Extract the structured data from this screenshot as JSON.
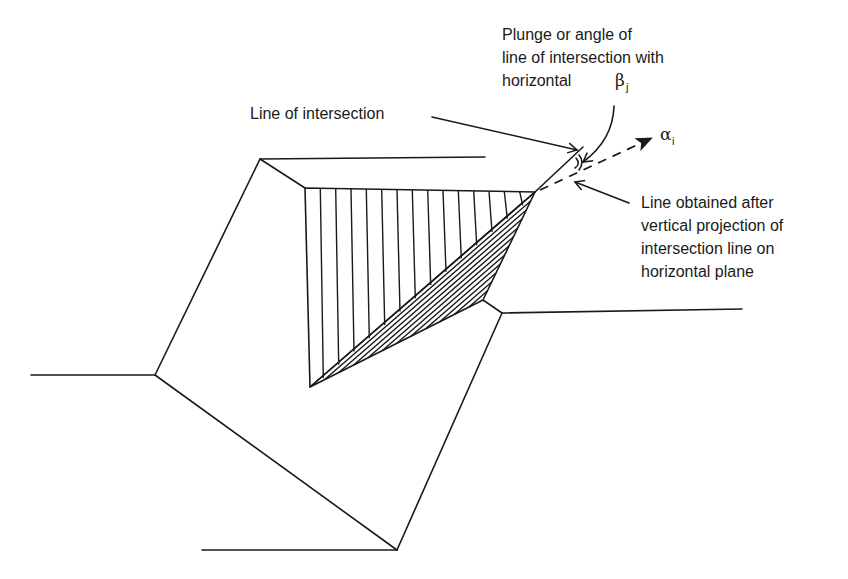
{
  "figure": {
    "type": "rock-wedge-slope-diagram",
    "labels": {
      "line_of_intersection": "Line of intersection",
      "plunge_line1": "Plunge or angle of",
      "plunge_line2": "line of intersection with",
      "plunge_line3": "horizontal",
      "projection_line1": "Line obtained after",
      "projection_line2": "vertical projection of",
      "projection_line3": "intersection line on",
      "projection_line4": "horizontal plane"
    },
    "symbols": {
      "beta": "β",
      "beta_sub": "j",
      "alpha": "α",
      "alpha_sub": "i"
    },
    "colors": {
      "ink": "#1a1a1a",
      "background": "#ffffff"
    }
  }
}
